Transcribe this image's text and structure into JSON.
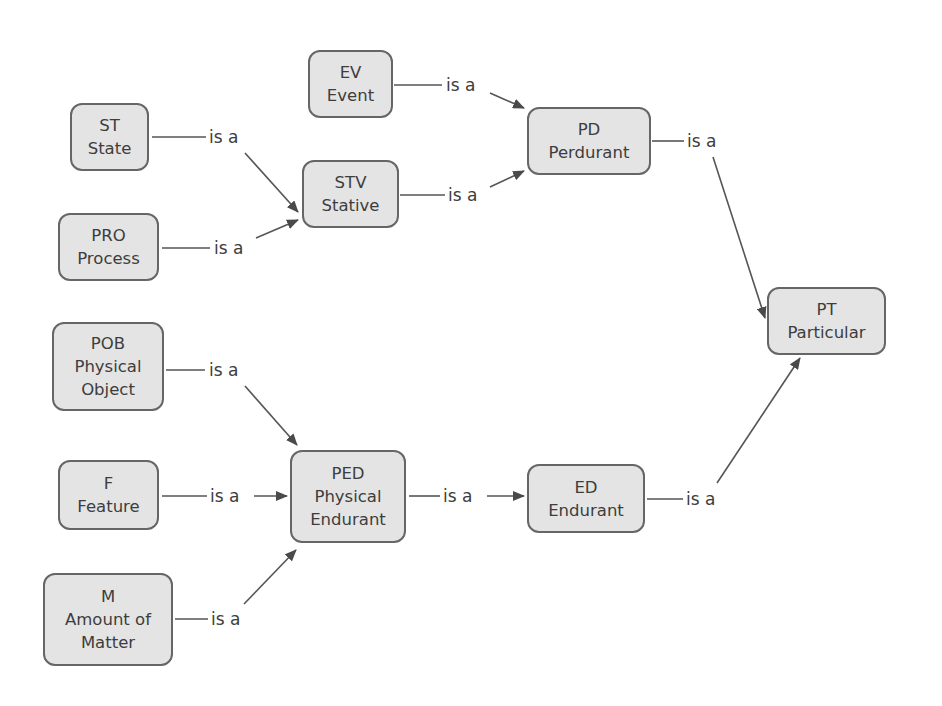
{
  "diagram": {
    "type": "taxonomy / is-a hierarchy",
    "colors": {
      "node_fill": "#e4e4e4",
      "node_border": "#666666",
      "edge": "#555555",
      "text": "#3d3d3d",
      "background": "#ffffff"
    },
    "nodes": {
      "ev": {
        "code": "EV",
        "name": "Event"
      },
      "st": {
        "code": "ST",
        "name": "State"
      },
      "pd": {
        "code": "PD",
        "name": "Perdurant"
      },
      "stv": {
        "code": "STV",
        "name": "Stative"
      },
      "pro": {
        "code": "PRO",
        "name": "Process"
      },
      "pt": {
        "code": "PT",
        "name": "Particular"
      },
      "pob": {
        "code": "POB",
        "name_line1": "Physical",
        "name_line2": "Object"
      },
      "ped": {
        "code": "PED",
        "name_line1": "Physical",
        "name_line2": "Endurant"
      },
      "ed": {
        "code": "ED",
        "name": "Endurant"
      },
      "f": {
        "code": "F",
        "name": "Feature"
      },
      "m": {
        "code": "M",
        "name_line1": "Amount of",
        "name_line2": "Matter"
      }
    },
    "edges": [
      {
        "from": "EV",
        "to": "PD",
        "label": "is a"
      },
      {
        "from": "ST",
        "to": "STV",
        "label": "is a"
      },
      {
        "from": "STV",
        "to": "PD",
        "label": "is a"
      },
      {
        "from": "PRO",
        "to": "STV",
        "label": "is a"
      },
      {
        "from": "PD",
        "to": "PT",
        "label": "is a"
      },
      {
        "from": "POB",
        "to": "PED",
        "label": "is a"
      },
      {
        "from": "F",
        "to": "PED",
        "label": "is a"
      },
      {
        "from": "PED",
        "to": "ED",
        "label": "is a"
      },
      {
        "from": "ED",
        "to": "PT",
        "label": "is a"
      },
      {
        "from": "M",
        "to": "PED",
        "label": "is a"
      }
    ]
  }
}
